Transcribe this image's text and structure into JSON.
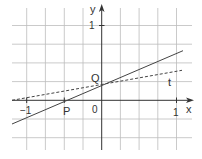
{
  "figure": {
    "type": "coordinate-graph",
    "axes": {
      "x_label": "x",
      "y_label": "y",
      "origin_label": "0",
      "x_tick_labels": [
        {
          "value": -1,
          "label": "−1"
        },
        {
          "value": 1,
          "label": "1"
        }
      ],
      "y_tick_labels": [
        {
          "value": 1,
          "label": "1"
        }
      ],
      "grid_step": 0.25
    },
    "points": [
      {
        "name": "P",
        "label": "P",
        "x": -0.5,
        "y": 0
      },
      {
        "name": "Q",
        "label": "Q",
        "x": 0,
        "y": 0.2
      }
    ],
    "lines": [
      {
        "name": "solid-line",
        "style": "solid",
        "through": [
          "P",
          "Q"
        ]
      },
      {
        "name": "t",
        "label": "t",
        "style": "dashed",
        "through": [
          "Q"
        ]
      }
    ],
    "colors": {
      "grid": "#b5b5b5",
      "axis": "#333333",
      "line": "#444444"
    }
  }
}
